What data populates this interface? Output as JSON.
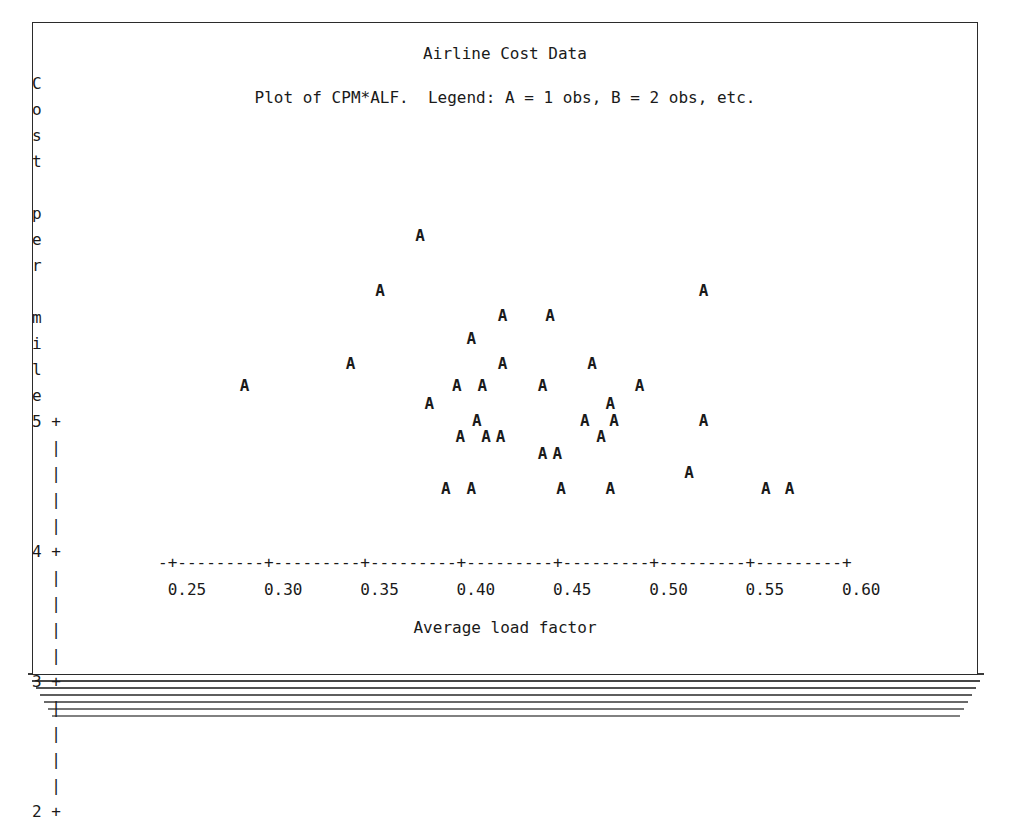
{
  "page": {
    "background_color": "#ffffff",
    "sheet_border_color": "#2b2b2b",
    "text_color": "#1a1a1a",
    "stack_line_count": 7
  },
  "chart_data": {
    "type": "scatter",
    "title": "Airline Cost Data",
    "subtitle": "Plot of CPM*ALF.  Legend: A = 1 obs, B = 2 obs, etc.",
    "xlabel": "Average load factor",
    "ylabel": "Cost per mile",
    "ylabel_chars": [
      "C",
      "o",
      "s",
      "t",
      "",
      "p",
      "e",
      "r",
      "",
      "m",
      "i",
      "l",
      "e"
    ],
    "xlim": [
      0.25,
      0.6
    ],
    "ylim": [
      2,
      5
    ],
    "xticks": [
      0.25,
      0.3,
      0.35,
      0.4,
      0.45,
      0.5,
      0.55,
      0.6
    ],
    "xtick_labels": [
      "0.25",
      "0.30",
      "0.35",
      "0.40",
      "0.45",
      "0.50",
      "0.55",
      "0.60"
    ],
    "yticks": [
      2,
      3,
      4,
      5
    ],
    "ytick_labels": [
      "2",
      "3",
      "4",
      "5"
    ],
    "grid": false,
    "legend": "A = 1 obs, B = 2 obs, etc.",
    "marker_glyph": "A",
    "axis_vertical_glyph": "|",
    "axis_tick_glyph": "+",
    "axis_horizontal_glyph": "-",
    "x_axis_line": "-+---------+---------+---------+---------+---------+---------+---------+",
    "x_tick_label_row": " 0.25      0.30      0.35      0.40      0.45      0.50      0.55      0.60",
    "points": [
      {
        "x": 0.383,
        "y": 4.42,
        "label": "A"
      },
      {
        "x": 0.287,
        "y": 3.27,
        "label": "A"
      },
      {
        "x": 0.361,
        "y": 4.0,
        "label": "A"
      },
      {
        "x": 0.428,
        "y": 3.81,
        "label": "A"
      },
      {
        "x": 0.454,
        "y": 3.81,
        "label": "A"
      },
      {
        "x": 0.538,
        "y": 4.0,
        "label": "A"
      },
      {
        "x": 0.411,
        "y": 3.63,
        "label": "A"
      },
      {
        "x": 0.345,
        "y": 3.44,
        "label": "A"
      },
      {
        "x": 0.428,
        "y": 3.44,
        "label": "A"
      },
      {
        "x": 0.477,
        "y": 3.44,
        "label": "A"
      },
      {
        "x": 0.403,
        "y": 3.27,
        "label": "A"
      },
      {
        "x": 0.417,
        "y": 3.27,
        "label": "A"
      },
      {
        "x": 0.45,
        "y": 3.27,
        "label": "A"
      },
      {
        "x": 0.503,
        "y": 3.27,
        "label": "A"
      },
      {
        "x": 0.388,
        "y": 3.13,
        "label": "A"
      },
      {
        "x": 0.487,
        "y": 3.13,
        "label": "A"
      },
      {
        "x": 0.414,
        "y": 3.0,
        "label": "A"
      },
      {
        "x": 0.473,
        "y": 3.0,
        "label": "A"
      },
      {
        "x": 0.489,
        "y": 3.0,
        "label": "A"
      },
      {
        "x": 0.538,
        "y": 3.0,
        "label": "A"
      },
      {
        "x": 0.405,
        "y": 2.88,
        "label": "A"
      },
      {
        "x": 0.419,
        "y": 2.88,
        "label": "A"
      },
      {
        "x": 0.427,
        "y": 2.88,
        "label": "A"
      },
      {
        "x": 0.482,
        "y": 2.88,
        "label": "A"
      },
      {
        "x": 0.45,
        "y": 2.75,
        "label": "A"
      },
      {
        "x": 0.458,
        "y": 2.75,
        "label": "A"
      },
      {
        "x": 0.53,
        "y": 2.6,
        "label": "A"
      },
      {
        "x": 0.397,
        "y": 2.48,
        "label": "A"
      },
      {
        "x": 0.411,
        "y": 2.48,
        "label": "A"
      },
      {
        "x": 0.46,
        "y": 2.48,
        "label": "A"
      },
      {
        "x": 0.487,
        "y": 2.48,
        "label": "A"
      },
      {
        "x": 0.572,
        "y": 2.48,
        "label": "A"
      },
      {
        "x": 0.585,
        "y": 2.48,
        "label": "A"
      }
    ]
  }
}
